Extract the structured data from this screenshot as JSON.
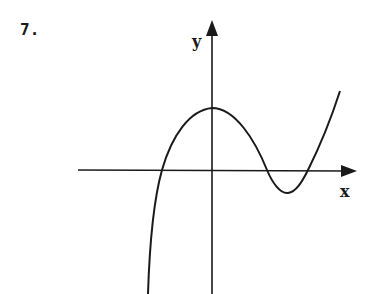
{
  "problem": {
    "number": "7."
  },
  "axes": {
    "x_label": "x",
    "y_label": "y"
  },
  "curve": {
    "description": "cubic-like curve: rises steeply from bottom left, crosses x-axis left of origin, local max on y-axis, crosses x-axis right, local min below axis, crosses again and rises",
    "color": "#1a1a1a"
  }
}
